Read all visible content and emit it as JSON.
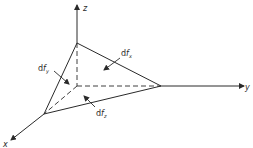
{
  "diagram": {
    "axes": {
      "z": "z",
      "y": "y",
      "x": "x"
    },
    "forces": {
      "dfx": {
        "prefix": "d",
        "f": "f",
        "sub": "x"
      },
      "dfy": {
        "prefix": "d",
        "f": "f",
        "sub": "y"
      },
      "dfz": {
        "prefix": "d",
        "f": "f",
        "sub": "z"
      }
    },
    "colors": {
      "line": "#2a2a2a",
      "background": "#ffffff"
    }
  }
}
